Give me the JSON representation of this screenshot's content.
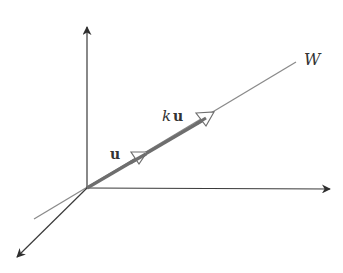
{
  "figure": {
    "type": "3d-axes-subspace-line",
    "labels": {
      "line": "W",
      "vector_u": "u",
      "vector_ku_scalar": "k",
      "vector_ku_vector": "u"
    },
    "colors": {
      "axes": "#3a3a3a",
      "line_w": "#8a8a8a",
      "vectors": "#6e6e6e",
      "arrowhead_outline": "#6e6e6e",
      "text": "#333333",
      "background": "#ffffff"
    }
  }
}
